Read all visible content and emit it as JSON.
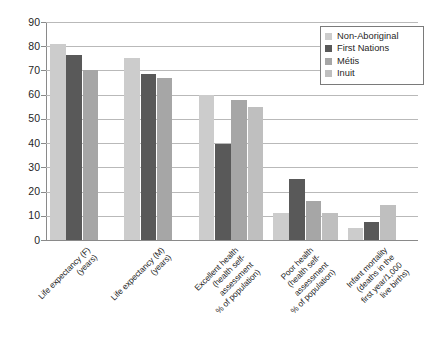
{
  "chart_data": {
    "type": "bar",
    "title": "",
    "subtitle": "",
    "xlabel": "",
    "ylabel": "",
    "ylim": [
      0,
      90
    ],
    "ytick_step": 10,
    "ytick_labels": [
      "90",
      "80",
      "70",
      "60",
      "50",
      "40",
      "30",
      "20",
      "10",
      "0"
    ],
    "grid": "horizontal",
    "legend_position": "top-right",
    "categories": [
      "Life expectancy (F)\n(years)",
      "Life expectancy (M)\n(years)",
      "Excellent health\n(health self-\nassessment\n% of population)",
      "Poor health\n(health self-\nassessment\n% of population)",
      "Infant mortality\n(deaths in the\nfirst year/1,000\nlive births)"
    ],
    "series": [
      {
        "name": "Non-Aboriginal",
        "color": "#cccccc",
        "values": [
          81,
          75,
          60,
          11,
          5
        ]
      },
      {
        "name": "First Nations",
        "color": "#595959",
        "values": [
          76.5,
          68.5,
          39.5,
          25,
          7.5
        ]
      },
      {
        "name": "Métis",
        "color": "#a6a6a6",
        "values": [
          70,
          67,
          58,
          16,
          null
        ]
      },
      {
        "name": "Inuit",
        "color": "#bfbfbf",
        "values": [
          null,
          null,
          55,
          11,
          14.5
        ]
      }
    ]
  },
  "legend": {
    "items": [
      {
        "label": "Non-Aboriginal",
        "color": "#cccccc"
      },
      {
        "label": "First Nations",
        "color": "#595959"
      },
      {
        "label": "Métis",
        "color": "#a6a6a6"
      },
      {
        "label": "Inuit",
        "color": "#bfbfbf"
      }
    ]
  }
}
